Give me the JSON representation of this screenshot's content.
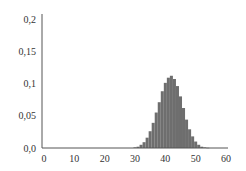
{
  "chart_data": {
    "type": "bar",
    "title": "",
    "xlabel": "",
    "ylabel": "",
    "xlim": [
      0,
      60
    ],
    "ylim": [
      0,
      0.2
    ],
    "grid": false,
    "legend": null,
    "bar_color": "#6e6e6e",
    "axis_color": "#555555",
    "xticks": [
      0,
      10,
      20,
      30,
      40,
      50,
      60
    ],
    "xtick_labels": [
      "0",
      "10",
      "20",
      "30",
      "40",
      "50",
      "60"
    ],
    "yticks": [
      0.0,
      0.05,
      0.1,
      0.15,
      0.2
    ],
    "ytick_labels": [
      "0,0",
      "0,05",
      "0,1",
      "0,15",
      "0,2"
    ],
    "x": [
      30,
      31,
      32,
      33,
      34,
      35,
      36,
      37,
      38,
      39,
      40,
      41,
      42,
      43,
      44,
      45,
      46,
      47,
      48,
      49,
      50,
      51,
      52,
      53,
      54
    ],
    "values": [
      0.001,
      0.002,
      0.005,
      0.009,
      0.016,
      0.026,
      0.039,
      0.055,
      0.071,
      0.088,
      0.101,
      0.109,
      0.112,
      0.107,
      0.096,
      0.08,
      0.062,
      0.044,
      0.029,
      0.018,
      0.01,
      0.005,
      0.002,
      0.001,
      0.0004
    ]
  }
}
